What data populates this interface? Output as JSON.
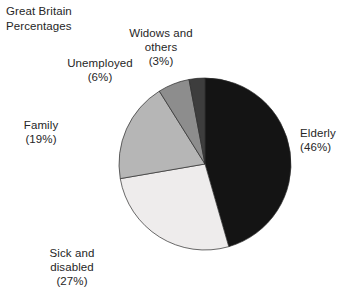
{
  "chart": {
    "title": "Great Britain\nPercentages"
  },
  "chart_data": {
    "type": "pie",
    "title": "Great Britain Percentages",
    "xlabel": "",
    "ylabel": "",
    "units": "percent",
    "legend_position": "none",
    "grid": false,
    "start_angle_deg": 0,
    "direction": "clockwise",
    "categories": [
      "Elderly",
      "Sick and disabled",
      "Family",
      "Unemployed",
      "Widows and others"
    ],
    "values": [
      46,
      27,
      19,
      6,
      3
    ],
    "colors": [
      "#141414",
      "#eeecec",
      "#b6b6b6",
      "#8d8d8d",
      "#3d3d3d"
    ],
    "slices": [
      {
        "name": "Elderly",
        "value": 46,
        "color": "#141414",
        "label": "Elderly\n(46%)",
        "label_align": "left",
        "label_x": 300,
        "label_y": 126
      },
      {
        "name": "Sick and disabled",
        "value": 27,
        "color": "#eeecec",
        "label": "Sick and\ndisabled\n(27%)",
        "label_align": "center",
        "label_x": 72,
        "label_y": 246
      },
      {
        "name": "Family",
        "value": 19,
        "color": "#b6b6b6",
        "label": "Family\n(19%)",
        "label_align": "center",
        "label_x": 41,
        "label_y": 118
      },
      {
        "name": "Unemployed",
        "value": 6,
        "color": "#8d8d8d",
        "label": "Unemployed\n(6%)",
        "label_align": "center",
        "label_x": 100,
        "label_y": 56
      },
      {
        "name": "Widows and others",
        "value": 3,
        "color": "#3d3d3d",
        "label": "Widows and\nothers\n(3%)",
        "label_align": "center",
        "label_x": 161,
        "label_y": 26
      }
    ],
    "geometry": {
      "center_x": 205,
      "center_y": 164,
      "radius": 86
    }
  }
}
